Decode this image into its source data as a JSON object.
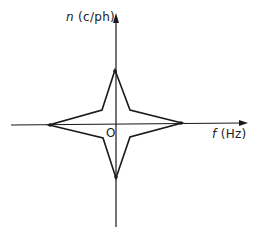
{
  "diagram": {
    "title": "",
    "axes": {
      "y_label_var": "n",
      "y_label_unit": "(c/ph)",
      "x_label_var": "f",
      "x_label_unit": "(Hz)",
      "origin_label": "O"
    },
    "shape": "four-pointed star centered at origin",
    "vertices": {
      "top": [
        115,
        70
      ],
      "right": [
        182,
        123
      ],
      "bottom": [
        116,
        178
      ],
      "left": [
        49,
        125
      ],
      "inner_top_right": [
        130,
        110
      ],
      "inner_bottom_right": [
        130,
        137
      ],
      "inner_bottom_left": [
        103,
        138
      ],
      "inner_top_left": [
        102,
        110
      ]
    },
    "colors": {
      "line": "#1a1a1a",
      "background": "#ffffff"
    }
  }
}
